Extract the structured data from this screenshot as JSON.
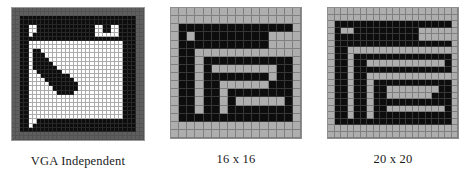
{
  "figure": {
    "background_color": "#ffffff",
    "panels": [
      {
        "id": "vga-independent",
        "caption": "VGA Independent",
        "grid_cols": 32,
        "grid_rows": 32,
        "palette": {
          "black": "#0d0d0d",
          "white": "#fdfdfd",
          "light_gray": "#aeaeae",
          "dark_gray": "#5e5e5e"
        },
        "rows": [
          "dddddddddddddddddddddddddddddddd",
          "dddddddddddddddddddddddddddddddd",
          "ddkkkkkkkkkkkkkkkkkkkkkkkkkkkkdd",
          "ddkkkkkkkkkkkkkkkkkkkkkkkkkkkkdd",
          "ddkkwwkkkkkkkkkkkkkkwwkkwwkkkkdd",
          "ddkkwwkkkkkkkkkkkkkkwwkkwwkkkkdd",
          "ddkkwkkkkkkkkkkkkkkkwwwwwwkkkkdd",
          "ddkkkkkkkkkkkkkkkkkkkkkkkkkkkkdd",
          "ddkkwwwwwwwwwwwwwwwwwwwwwwwkkkdd",
          "ddkkwwwwwwwwwwwwwwwwwwwwwwwkkkdd",
          "ddkkwkkwwwwwwwwwwwwwwwwwwwwkkkdd",
          "ddkkwkkkwwwwwwwwwwwwwwwwwwwkkkdd",
          "ddkkwkkkkwwwwwwwwwwwwwwwwwwkkkdd",
          "ddkkwkkkkkwwwwwwwwwwwwwwwwwkkkdd",
          "ddkkwkkkkkkwwwwwwwwwwwwwwwwkkkdd",
          "ddkkwwkkkkkkwwwwwwwwwwwwwwwkkkdd",
          "ddkkwwwkkkkkkkwwwwwwwwwwwwwkkkdd",
          "ddkkwwwwkkkkkkkwwwwwwwwwwwwkkkdd",
          "ddkkwwwwwkkkkkkkwwwwwwwwwwwkkkdd",
          "ddkkwwwwwwkkkkkkwwwwwwwwwwwkkkdd",
          "ddkkwwwwwwwkkkkwwwwwwwwwwwwkkkdd",
          "ddkkwwwwwwwwwwwwwwwwwwwwwwwkkkdd",
          "ddkkwwwwwwwwwwwwwwwwwwwwwwwkkkdd",
          "ddkkwwwwwwwwwwwwwwwwwwwwwwwkkkdd",
          "ddkkwwwwwwwwwwwwwwwwwwwwwwwkkkdd",
          "ddkkwwwwwwwwwwwwwwwwwwwwwwwkkkdd",
          "ddkkwwwwwwwwwwwwwwwwwwwwwwwkkkdd",
          "ddkkwwkkkkkkkkkkkkkkkkkkkkkkkkdd",
          "ddkkwkkkkkkkkkkkkkkkkkkkkkkkkkdd",
          "ddkkkkkkkkkkkkkkkkkkkkkkkkkkkkdd",
          "dddddddddddddddddddddddddddddddd",
          "dddddddddddddddddddddddddddddddd"
        ]
      },
      {
        "id": "icon-16x16",
        "caption": "16 x 16",
        "grid_cols": 16,
        "grid_rows": 16,
        "palette": {
          "black": "#0d0d0d",
          "light_gray": "#aeaeae"
        },
        "rows": [
          "gggggggggggggggg",
          "gggggggggggggggg",
          "gkkkkkkkkkkkkkkg",
          "gkgkkkkkkkkkgggg",
          "gkkkkkkkkkkkgggg",
          "gkkggggggggggggg",
          "gkkgkkkkkkkkkkkg",
          "gkkgkggggggggkkg",
          "gkkgkkkkkkkkgkkg",
          "gkkgkkggggggkkkg",
          "gkkgkkgkkkkkkkkg",
          "gkkgkkgkggggggkg",
          "gkkgkkgkkkkkkkkg",
          "gkkkkkkkkkkkkkkg",
          "gggggggggggggggg",
          "gggggggggggggggg"
        ]
      },
      {
        "id": "icon-20x20",
        "caption": "20 x 20",
        "grid_cols": 20,
        "grid_rows": 20,
        "palette": {
          "black": "#0d0d0d",
          "light_gray": "#aeaeae"
        },
        "rows": [
          "gggggggggggggggggggg",
          "gggggggggggggggggggg",
          "gkkkkkkkkkkkkkkkkkkg",
          "gkggkkkkkkkkkkgggggg",
          "gkkkkkkkkkkkkkgggggg",
          "gkkkkkkkkkkkkkkkkkkg",
          "gkkggggggggggggggggg",
          "gkkgkkkkkkkkkkkkkkkg",
          "gkkgkkggggggggggggkg",
          "gkkgkkkkkkkkkkkkkkkg",
          "gkkgkkgggggggggggggg",
          "gkkgkkgkkkkkkkkkkkkg",
          "gkkgkkgkkggggggggkkg",
          "gkkgkkgkkgggggggkkkg",
          "gkkgkkgkkkkkkkkkkkkg",
          "gkkgkkgkkgggggggggkg",
          "gkkgkkgkkkkkkkkkkkkg",
          "gkkkkkkkkkkkkkkkkkkg",
          "gggggggggggggggggggg",
          "gggggggggggggggggggg"
        ]
      }
    ]
  }
}
